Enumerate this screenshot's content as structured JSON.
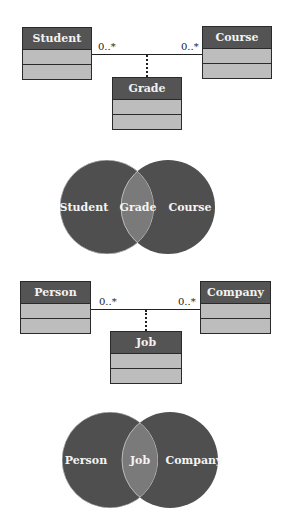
{
  "diagram1": {
    "uml": {
      "left_class": "Student",
      "right_class": "Course",
      "association_class": "Grade",
      "left_multiplicity": "0..*",
      "right_multiplicity": "0..*"
    },
    "venn": {
      "left": "Student",
      "intersection": "Grade",
      "right": "Course"
    }
  },
  "diagram2": {
    "uml": {
      "left_class": "Person",
      "right_class": "Company",
      "association_class": "Job",
      "left_multiplicity": "0..*",
      "right_multiplicity": "0..*"
    },
    "venn": {
      "left": "Person",
      "intersection": "Job",
      "right": "Company"
    }
  },
  "colors": {
    "class_header": "#545454",
    "class_body": "#bdbdbd",
    "venn_circle": "#4f4f4f",
    "venn_intersection": "#7a7a7a"
  }
}
